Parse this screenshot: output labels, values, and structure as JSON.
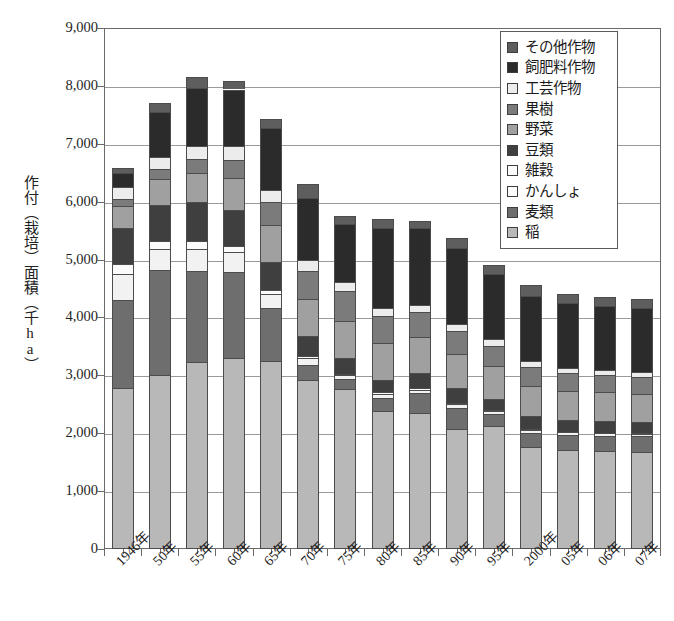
{
  "chart_data": {
    "type": "bar",
    "subtype": "stacked-bar",
    "title": "",
    "xlabel": "",
    "ylabel": "作付（栽培）面積（千ha）",
    "ylim": [
      0,
      9000
    ],
    "ytick_values": [
      0,
      1000,
      2000,
      3000,
      4000,
      5000,
      6000,
      7000,
      8000,
      9000
    ],
    "ytick_labels": [
      "0",
      "1,000",
      "2,000",
      "3,000",
      "4,000",
      "5,000",
      "6,000",
      "7,000",
      "8,000",
      "9,000"
    ],
    "grid": true,
    "legend_position": "top-right",
    "categories": [
      "1946年",
      "50年",
      "55年",
      "60年",
      "65年",
      "70年",
      "75年",
      "80年",
      "85年",
      "90年",
      "95年",
      "2000年",
      "05年",
      "06年",
      "07年"
    ],
    "series": [
      {
        "name": "稲",
        "color": "#b8b8b8",
        "values": [
          2780,
          3011,
          3222,
          3308,
          3255,
          2923,
          2764,
          2377,
          2342,
          2074,
          2118,
          1770,
          1706,
          1688,
          1673
        ]
      },
      {
        "name": "麦類",
        "color": "#6e6e6e",
        "values": [
          1530,
          1802,
          1585,
          1484,
          908,
          250,
          170,
          238,
          348,
          367,
          212,
          237,
          268,
          272,
          274
        ]
      },
      {
        "name": "かんしょ",
        "color": "#f2f2f2",
        "values": [
          443,
          372,
          384,
          332,
          238,
          129,
          65,
          65,
          63,
          61,
          58,
          53,
          41,
          41,
          41
        ]
      },
      {
        "name": "雑穀",
        "color": "#fbfbfb",
        "values": [
          164,
          140,
          130,
          108,
          65,
          38,
          30,
          25,
          22,
          18,
          14,
          12,
          10,
          10,
          10
        ]
      },
      {
        "name": "豆類",
        "color": "#3f3f3f",
        "values": [
          635,
          612,
          670,
          621,
          499,
          336,
          270,
          215,
          268,
          270,
          195,
          218,
          203,
          200,
          198
        ]
      },
      {
        "name": "野菜",
        "color": "#a0a0a0",
        "values": [
          370,
          453,
          513,
          564,
          630,
          639,
          645,
          639,
          622,
          587,
          563,
          529,
          503,
          495,
          490
        ]
      },
      {
        "name": "果樹",
        "color": "#7b7b7b",
        "values": [
          122,
          172,
          232,
          301,
          402,
          495,
          508,
          458,
          421,
          385,
          345,
          326,
          301,
          296,
          292
        ]
      },
      {
        "name": "工芸作物",
        "color": "#ececec",
        "values": [
          206,
          215,
          234,
          240,
          210,
          176,
          155,
          140,
          137,
          130,
          117,
          101,
          92,
          90,
          88
        ]
      },
      {
        "name": "飼肥料作物",
        "color": "#2b2b2b",
        "values": [
          245,
          770,
          1000,
          980,
          1060,
          1080,
          1010,
          1380,
          1330,
          1300,
          1130,
          1130,
          1120,
          1110,
          1105
        ]
      },
      {
        "name": "その他作物",
        "color": "#5e5e5e",
        "values": [
          90,
          160,
          185,
          145,
          155,
          235,
          130,
          160,
          105,
          175,
          155,
          190,
          155,
          145,
          140
        ]
      }
    ],
    "totals": [
      6585,
      7707,
      8155,
      8083,
      7422,
      6301,
      5747,
      5697,
      5658,
      5367,
      4907,
      4566,
      4399,
      4347,
      4311
    ]
  },
  "legend": {
    "items": [
      {
        "label": "その他作物",
        "color": "#5e5e5e"
      },
      {
        "label": "飼肥料作物",
        "color": "#2b2b2b"
      },
      {
        "label": "工芸作物",
        "color": "#ececec"
      },
      {
        "label": "果樹",
        "color": "#7b7b7b"
      },
      {
        "label": "野菜",
        "color": "#a0a0a0"
      },
      {
        "label": "豆類",
        "color": "#3f3f3f"
      },
      {
        "label": "雑穀",
        "color": "#fbfbfb"
      },
      {
        "label": "かんしょ",
        "color": "#fbfbfb"
      },
      {
        "label": "麦類",
        "color": "#6e6e6e"
      },
      {
        "label": "稲",
        "color": "#b8b8b8"
      }
    ]
  },
  "axis": {
    "y_title": "作付（栽培）面積（千ha）"
  },
  "colors": {
    "frame": "#6a6a6a",
    "grid": "#9a9a9a",
    "bar_outline": "#4c4c4c",
    "background": "#ffffff"
  }
}
